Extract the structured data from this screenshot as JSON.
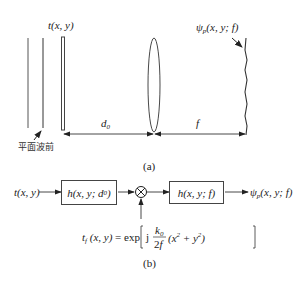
{
  "part_a": {
    "caption": "(a)",
    "input_label": "t(x, y)",
    "wavefront_label": "平面波前",
    "output_label": "ψp(x, y; f)",
    "distance_1": "d0",
    "distance_2": "f"
  },
  "part_b": {
    "caption": "(b)",
    "input": "t(x, y)",
    "block1": "h(x, y; d0)",
    "multiplier_symbol": "⊗",
    "block2": "h(x, y; f)",
    "output": "ψp(x, y; f)",
    "lens_function": "tf(x, y) = exp[ j k0/(2f) (x² + y²) ]"
  }
}
